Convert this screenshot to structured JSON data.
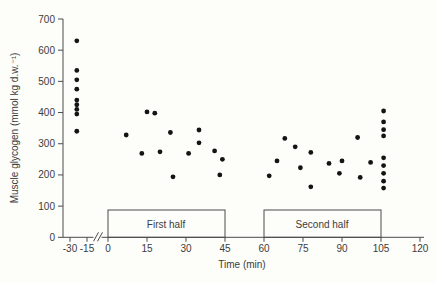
{
  "chart_data": {
    "type": "scatter",
    "title": "",
    "xlabel": "Time (min)",
    "ylabel": "Muscle glycogen (mmol kg d.w.⁻¹)",
    "ylim": [
      0,
      700
    ],
    "y_ticks": [
      0,
      100,
      200,
      300,
      400,
      500,
      600,
      700
    ],
    "x_ticks_pre_break": [
      -30,
      -15
    ],
    "x_ticks_main": [
      0,
      15,
      30,
      45,
      60,
      75,
      90,
      105,
      120
    ],
    "x_axis_break_between": [
      -15,
      0
    ],
    "grid": false,
    "legend": "none",
    "point_color": "#141414",
    "axis_color": "#4a4a4a",
    "annotations": [
      {
        "label": "First half",
        "x_start": 0,
        "x_end": 45
      },
      {
        "label": "Second half",
        "x_start": 60,
        "x_end": 105
      }
    ],
    "series": [
      {
        "name": "pre-match",
        "points": [
          [
            -24,
            630
          ],
          [
            -24,
            535
          ],
          [
            -24,
            505
          ],
          [
            -24,
            475
          ],
          [
            -24,
            440
          ],
          [
            -24,
            425
          ],
          [
            -24,
            410
          ],
          [
            -24,
            395
          ],
          [
            -24,
            340
          ]
        ]
      },
      {
        "name": "first-half",
        "points": [
          [
            7,
            328
          ],
          [
            13,
            269
          ],
          [
            15,
            402
          ],
          [
            18,
            398
          ],
          [
            20,
            274
          ],
          [
            24,
            336
          ],
          [
            25,
            194
          ],
          [
            31,
            269
          ],
          [
            35,
            344
          ],
          [
            35,
            303
          ],
          [
            41,
            277
          ],
          [
            43,
            200
          ],
          [
            44,
            250
          ]
        ]
      },
      {
        "name": "second-half",
        "points": [
          [
            62,
            197
          ],
          [
            65,
            245
          ],
          [
            68,
            317
          ],
          [
            72,
            290
          ],
          [
            74,
            223
          ],
          [
            78,
            272
          ],
          [
            78,
            162
          ],
          [
            85,
            237
          ],
          [
            89,
            205
          ],
          [
            90,
            245
          ],
          [
            96,
            320
          ],
          [
            97,
            192
          ],
          [
            101,
            240
          ]
        ]
      },
      {
        "name": "post-match",
        "points": [
          [
            106,
            405
          ],
          [
            106,
            370
          ],
          [
            106,
            345
          ],
          [
            106,
            325
          ],
          [
            106,
            255
          ],
          [
            106,
            230
          ],
          [
            106,
            205
          ],
          [
            106,
            180
          ],
          [
            106,
            158
          ]
        ]
      }
    ]
  }
}
